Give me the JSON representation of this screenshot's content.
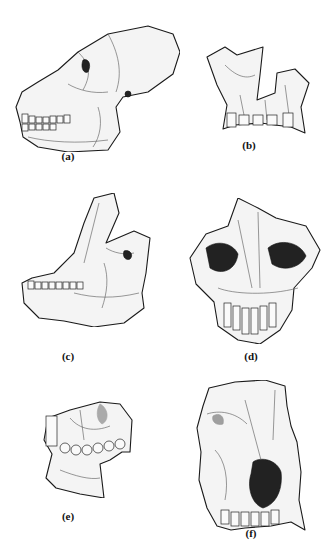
{
  "figure": {
    "panels": [
      {
        "id": "a",
        "label": "(a)",
        "subject": "skull lateral view with mandible"
      },
      {
        "id": "b",
        "label": "(b)",
        "subject": "maxilla fragment frontal view"
      },
      {
        "id": "c",
        "label": "(c)",
        "subject": "cranium with mandible oblique view"
      },
      {
        "id": "d",
        "label": "(d)",
        "subject": "face frontal view"
      },
      {
        "id": "e",
        "label": "(e)",
        "subject": "maxilla and mandible fragment lateral view"
      },
      {
        "id": "f",
        "label": "(f)",
        "subject": "face frontal view"
      }
    ]
  }
}
